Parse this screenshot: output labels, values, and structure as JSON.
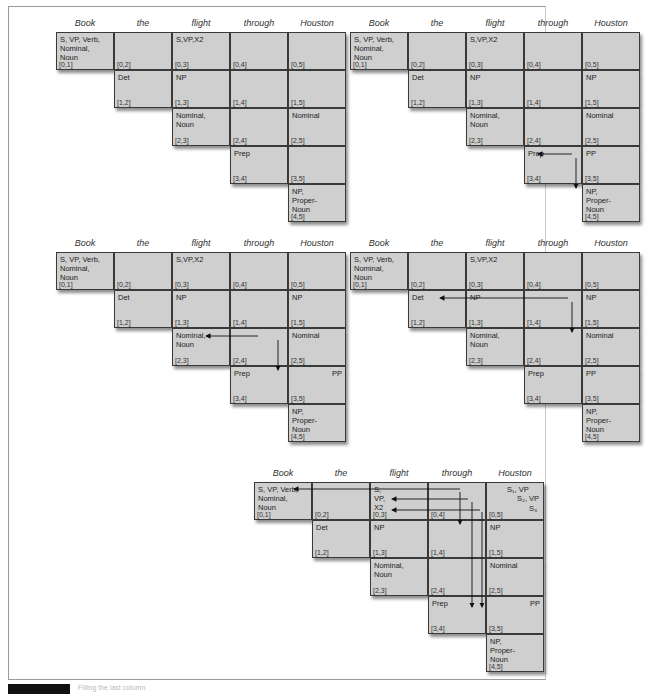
{
  "figure": {
    "words": [
      "Book",
      "the",
      "flight",
      "through",
      "Houston"
    ],
    "caption_label": "Figure 13.13",
    "caption_text": "Filling the last column"
  },
  "panels": [
    {
      "id": "panel-1",
      "cells": {
        "0_1": "S, VP, Verb,\nNominal,\nNoun",
        "0_2": "",
        "0_3": "S,VP,X2",
        "0_4": "",
        "0_5": "",
        "1_2": "Det",
        "1_3": "NP",
        "1_4": "",
        "1_5": "",
        "2_3": "Nominal,\nNoun",
        "2_4": "",
        "2_5": "Nominal",
        "3_4": "Prep",
        "3_5": "",
        "4_5": "NP,\nProper-\nNoun"
      }
    },
    {
      "id": "panel-2",
      "cells": {
        "0_1": "S, VP, Verb,\nNominal,\nNoun",
        "0_2": "",
        "0_3": "S,VP,X2",
        "0_4": "",
        "0_5": "",
        "1_2": "Det",
        "1_3": "NP",
        "1_4": "",
        "1_5": "NP",
        "2_3": "Nominal,\nNoun",
        "2_4": "",
        "2_5": "Nominal",
        "3_4": "Prep",
        "3_5": "PP",
        "4_5": "NP,\nProper-\nNoun"
      },
      "arrows": [
        "[3,5] PP -> [3,4] Prep",
        "[3,5] PP -> [4,5] NP"
      ]
    },
    {
      "id": "panel-3",
      "cells": {
        "0_1": "S, VP, Verb,\nNominal,\nNoun",
        "0_2": "",
        "0_3": "S,VP,X2",
        "0_4": "",
        "0_5": "",
        "1_2": "Det",
        "1_3": "NP",
        "1_4": "",
        "1_5": "NP",
        "2_3": "Nominal,\nNoun",
        "2_4": "",
        "2_5": "Nominal",
        "3_4": "Prep",
        "3_5": "PP",
        "4_5": "NP,\nProper-\nNoun"
      },
      "arrows": [
        "[2,5] Nominal -> [2,3] Nominal",
        "[2,5] Nominal -> [3,5] PP"
      ]
    },
    {
      "id": "panel-4",
      "cells": {
        "0_1": "S, VP, Verb,\nNominal,\nNoun",
        "0_2": "",
        "0_3": "S,VP,X2",
        "0_4": "",
        "0_5": "",
        "1_2": "Det",
        "1_3": "NP",
        "1_4": "",
        "1_5": "NP",
        "2_3": "Nominal,\nNoun",
        "2_4": "",
        "2_5": "Nominal",
        "3_4": "Prep",
        "3_5": "PP",
        "4_5": "NP,\nProper-\nNoun"
      },
      "arrows": [
        "[1,5] NP -> [1,2] Det",
        "[1,5] NP -> [2,5] Nominal"
      ]
    },
    {
      "id": "panel-5",
      "cells": {
        "0_1": "S, VP, Verb,\nNominal,\nNoun",
        "0_2": "",
        "0_3": "S,\nVP,\nX2",
        "0_4": "",
        "0_5": "S1, VP\nS2, VP\nS3",
        "1_2": "Det",
        "1_3": "NP",
        "1_4": "",
        "1_5": "NP",
        "2_3": "Nominal,\nNoun",
        "2_4": "",
        "2_5": "Nominal",
        "3_4": "Prep",
        "3_5": "PP",
        "4_5": "NP,\nProper-\nNoun"
      },
      "s_labels": {
        "s1": "S₁, VP",
        "s2": "S₂, VP",
        "s3": "S₃"
      },
      "arrows": [
        "S1 -> [0,1]",
        "S1 -> [1,5] NP",
        "S2 -> [0,3] VP",
        "S2 -> [3,5] PP",
        "S3 -> [0,3] X2",
        "S3 -> [3,5] PP"
      ]
    }
  ]
}
